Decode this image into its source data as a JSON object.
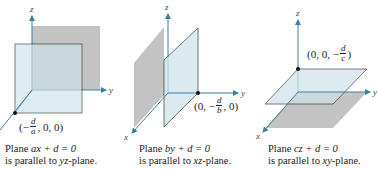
{
  "figure": {
    "colors": {
      "plane_blue": "#cfe3ea",
      "plane_gray": "#b9b9b9",
      "axis": "#3a7fa5",
      "edge": "#2a2a2a"
    },
    "panels": [
      {
        "id": "yz",
        "axes": {
          "x": "x",
          "y": "y",
          "z": "z"
        },
        "point_label": {
          "prefix": "(−",
          "num": "d",
          "den": "a",
          "suffix": ", 0, 0)"
        },
        "caption_line1": {
          "pre": "Plane ",
          "eq": "ax + d = 0"
        },
        "caption_line2": {
          "pre": "is parallel to ",
          "plane": "yz",
          "post": "-plane."
        }
      },
      {
        "id": "xz",
        "axes": {
          "x": "x",
          "y": "y",
          "z": "z"
        },
        "point_label": {
          "prefix": "(0, −",
          "num": "d",
          "den": "b",
          "suffix": ", 0)"
        },
        "caption_line1": {
          "pre": "Plane ",
          "eq": "by + d = 0"
        },
        "caption_line2": {
          "pre": "is parallel to ",
          "plane": "xz",
          "post": "-plane."
        }
      },
      {
        "id": "xy",
        "axes": {
          "x": "x",
          "y": "y",
          "z": "z"
        },
        "point_label": {
          "prefix": "(0, 0, −",
          "num": "d",
          "den": "c",
          "suffix": ")"
        },
        "caption_line1": {
          "pre": "Plane ",
          "eq": "cz + d = 0"
        },
        "caption_line2": {
          "pre": "is parallel to ",
          "plane": "xy",
          "post": "-plane."
        }
      }
    ]
  }
}
